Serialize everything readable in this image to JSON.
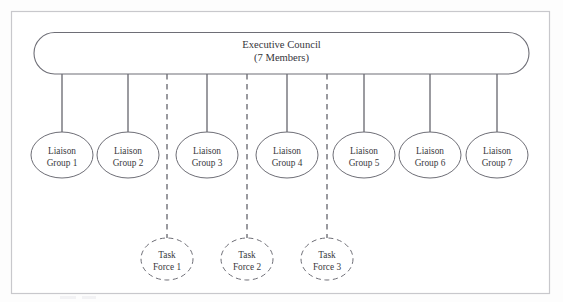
{
  "diagram": {
    "colors": {
      "node_stroke": "#6e6e76",
      "connector": "#5f5f67",
      "frame": "#c8c8cc",
      "text": "#3a3a40",
      "background": "#ffffff"
    },
    "root": {
      "name": "executive-council",
      "line1": "Executive Council",
      "line2": "(7 Members)",
      "shape": "rounded-pill",
      "border_style": "solid"
    },
    "liaison_groups": [
      {
        "line1": "Liaison",
        "line2": "Group 1",
        "cx": 62,
        "cy": 155,
        "connector": "solid"
      },
      {
        "line1": "Liaison",
        "line2": "Group 2",
        "cx": 128,
        "cy": 155,
        "connector": "solid"
      },
      {
        "line1": "Liaison",
        "line2": "Group 3",
        "cx": 207,
        "cy": 155,
        "connector": "solid"
      },
      {
        "line1": "Liaison",
        "line2": "Group 4",
        "cx": 287,
        "cy": 155,
        "connector": "solid"
      },
      {
        "line1": "Liaison",
        "line2": "Group 5",
        "cx": 364,
        "cy": 155,
        "connector": "solid"
      },
      {
        "line1": "Liaison",
        "line2": "Group 6",
        "cx": 430,
        "cy": 155,
        "connector": "solid"
      },
      {
        "line1": "Liaison",
        "line2": "Group 7",
        "cx": 497,
        "cy": 155,
        "connector": "solid"
      }
    ],
    "task_forces": [
      {
        "line1": "Task",
        "line2": "Force 1",
        "cx": 167,
        "cy": 259,
        "connector": "dashed",
        "border_style": "dashed"
      },
      {
        "line1": "Task",
        "line2": "Force 2",
        "cx": 247,
        "cy": 259,
        "connector": "dashed",
        "border_style": "dashed"
      },
      {
        "line1": "Task",
        "line2": "Force 3",
        "cx": 327,
        "cy": 259,
        "connector": "dashed",
        "border_style": "dashed"
      }
    ]
  }
}
